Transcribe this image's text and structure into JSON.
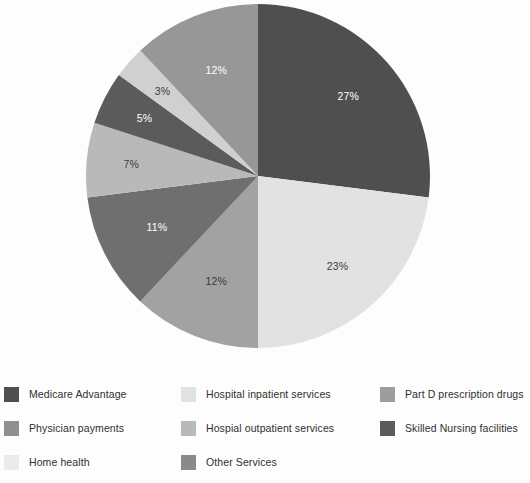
{
  "chart_data": {
    "type": "pie",
    "title": "",
    "subtitle": "",
    "xlabel": "",
    "ylabel": "",
    "grid": false,
    "legend_position": "bottom",
    "units": "percent",
    "start_angle_deg": 0,
    "direction": "clockwise",
    "center": {
      "x": 258,
      "y": 176
    },
    "radius": 172,
    "categories": [
      "Medicare Advantage",
      "Hospital inpatient services",
      "Physician payments",
      "Part D prescription drugs",
      "Hospial outpatient services",
      "Skilled Nursing facilities",
      "Home health",
      "Other Services"
    ],
    "values": [
      27,
      23,
      12,
      11,
      7,
      5,
      3,
      12
    ],
    "labels": [
      "27%",
      "23%",
      "12%",
      "11%",
      "7%",
      "5%",
      "3%",
      "12%"
    ],
    "colors": [
      "#4f4f4f",
      "#e2e2e2",
      "#a2a2a2",
      "#6f6f6f",
      "#b9b9b9",
      "#5b5b5b",
      "#d0d0d0",
      "#979797"
    ],
    "label_colors": [
      "#ffffff",
      "#3a3a3a",
      "#3a3a3a",
      "#ffffff",
      "#3a3a3a",
      "#ffffff",
      "#3a3a3a",
      "#ffffff"
    ],
    "slices": [
      {
        "label": "27%",
        "value": 27,
        "category": "Medicare Advantage",
        "color": "#4f4f4f",
        "label_color": "#ffffff"
      },
      {
        "label": "23%",
        "value": 23,
        "category": "Hospital inpatient services",
        "color": "#e2e2e2",
        "label_color": "#3a3a3a"
      },
      {
        "label": "12%",
        "value": 12,
        "category": "Physician payments",
        "color": "#a2a2a2",
        "label_color": "#3a3a3a"
      },
      {
        "label": "11%",
        "value": 11,
        "category": "Part D prescription drugs",
        "color": "#6f6f6f",
        "label_color": "#ffffff"
      },
      {
        "label": "7%",
        "value": 7,
        "category": "Hospial outpatient services",
        "color": "#b9b9b9",
        "label_color": "#3a3a3a"
      },
      {
        "label": "5%",
        "value": 5,
        "category": "Skilled Nursing facilities",
        "color": "#5b5b5b",
        "label_color": "#ffffff"
      },
      {
        "label": "3%",
        "value": 3,
        "category": "Home health",
        "color": "#d0d0d0",
        "label_color": "#3a3a3a"
      },
      {
        "label": "12%",
        "value": 12,
        "category": "Other Services",
        "color": "#979797",
        "label_color": "#ffffff"
      }
    ]
  },
  "legend": {
    "columns": 3,
    "items": [
      {
        "label": "Medicare Advantage",
        "color": "#4f4f4f",
        "col": 0,
        "row": 0
      },
      {
        "label": "Hospital inpatient services",
        "color": "#e2e2e2",
        "col": 1,
        "row": 0
      },
      {
        "label": "Part D prescription drugs",
        "color": "#9d9d9d",
        "col": 2,
        "row": 0
      },
      {
        "label": "Physician payments",
        "color": "#8f8f8f",
        "col": 0,
        "row": 1
      },
      {
        "label": "Hospial outpatient services",
        "color": "#b9b9b9",
        "col": 1,
        "row": 1
      },
      {
        "label": "Skilled Nursing facilities",
        "color": "#5b5b5b",
        "col": 2,
        "row": 1
      },
      {
        "label": "Home health",
        "color": "#ebebeb",
        "col": 0,
        "row": 2
      },
      {
        "label": "Other Services",
        "color": "#8a8a8a",
        "col": 1,
        "row": 2
      }
    ]
  },
  "colors": {
    "background": "#fdfdfd",
    "text": "#2f2f2f"
  }
}
